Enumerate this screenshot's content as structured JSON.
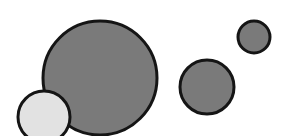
{
  "diagram": {
    "background": "#ffffff",
    "stroke_color": "#151515",
    "stroke_width": 3,
    "circles": [
      {
        "id": "large-dark",
        "cx": 100,
        "cy": 78,
        "r": 57,
        "fill": "#7a7a7a"
      },
      {
        "id": "medium-dark",
        "cx": 207,
        "cy": 87,
        "r": 27,
        "fill": "#7a7a7a"
      },
      {
        "id": "small-dark",
        "cx": 254,
        "cy": 37,
        "r": 16,
        "fill": "#7a7a7a"
      },
      {
        "id": "light",
        "cx": 44,
        "cy": 117,
        "r": 26,
        "fill": "#e2e2e2"
      }
    ]
  }
}
